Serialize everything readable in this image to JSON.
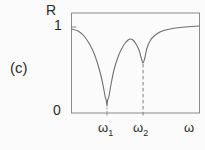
{
  "figure": {
    "panel_label": "(c)",
    "y_axis_label": "R",
    "y_tick_top": "1",
    "y_tick_bottom": "0",
    "x_axis_label": "ω",
    "x_ticks": [
      {
        "base": "ω",
        "sub": "1"
      },
      {
        "base": "ω",
        "sub": "2"
      }
    ]
  },
  "colors": {
    "background": "#fbfbfb",
    "frame": "#8a8a8a",
    "line": "#6f6f6f",
    "text": "#2b2b2b"
  },
  "chart_data": {
    "type": "line",
    "xlabel": "ω",
    "ylabel": "R",
    "ylim": [
      0,
      1.16
    ],
    "xlim_normalized": [
      0,
      1
    ],
    "grid": false,
    "legend": "none",
    "y_ticks": [
      0,
      1
    ],
    "series": [
      {
        "name": "R",
        "points_x_normalized": [
          0.0,
          0.051,
          0.098,
          0.145,
          0.184,
          0.223,
          0.246,
          0.262,
          0.273,
          0.277,
          0.281,
          0.293,
          0.309,
          0.332,
          0.363,
          0.395,
          0.426,
          0.457,
          0.48,
          0.504,
          0.527,
          0.543,
          0.559,
          0.574,
          0.59,
          0.613,
          0.645,
          0.691,
          0.77,
          0.887,
          1.0
        ],
        "points_R": [
          0.977,
          0.953,
          0.895,
          0.791,
          0.663,
          0.477,
          0.326,
          0.198,
          0.14,
          0.081,
          0.14,
          0.198,
          0.337,
          0.5,
          0.651,
          0.756,
          0.826,
          0.86,
          0.849,
          0.802,
          0.733,
          0.651,
          0.581,
          0.651,
          0.756,
          0.837,
          0.895,
          0.942,
          0.977,
          1.0,
          1.012
        ],
        "local_max_between_dips_R": 0.86
      }
    ],
    "features": {
      "dip1": {
        "label": "ω1",
        "x_normalized": 0.277,
        "R_min": 0.081,
        "guide_style": "dotted"
      },
      "dip2": {
        "label": "ω2",
        "x_normalized": 0.559,
        "R_min": 0.581,
        "guide_style": "dashed"
      }
    }
  }
}
